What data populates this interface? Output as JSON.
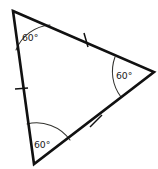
{
  "figure": {
    "shape": "triangle",
    "background_color": "#ffffff",
    "stroke_color": "#111111",
    "arc_color": "#33332f",
    "label_color": "#1a1a1a"
  },
  "vertices": [
    {
      "name": "top-left",
      "x": 13,
      "y": 11
    },
    {
      "name": "right",
      "x": 154,
      "y": 72
    },
    {
      "name": "bottom",
      "x": 34,
      "y": 164
    }
  ],
  "angles": [
    {
      "vertex": "top-left",
      "label": "60°",
      "value": 60,
      "unit": "degrees",
      "label_x": 22,
      "label_y": 41
    },
    {
      "vertex": "right",
      "label": "60°",
      "value": 60,
      "unit": "degrees",
      "label_x": 116,
      "label_y": 79
    },
    {
      "vertex": "bottom",
      "label": "60°",
      "value": 60,
      "unit": "degrees",
      "label_x": 34,
      "label_y": 148
    }
  ],
  "tick_marks": [
    {
      "side": "left-side",
      "x": 21,
      "y": 89,
      "congruence": "single-hash"
    },
    {
      "side": "top-right-side",
      "x": 86,
      "y": 40,
      "congruence": "single-hash"
    },
    {
      "side": "bottom-right-side",
      "x": 96,
      "y": 121,
      "congruence": "single-hash"
    }
  ],
  "paths": {
    "triangle_outline": "M 13 11 L 154 72 L 34 164 Z",
    "arc_top_left": "M 16 50 A 40 40 0 0 1 50 25",
    "arc_right": "M 115 57 A 42 42 0 0 0 121 97",
    "arc_bottom": "M 27 124 A 41 41 0 0 1 70 140"
  }
}
